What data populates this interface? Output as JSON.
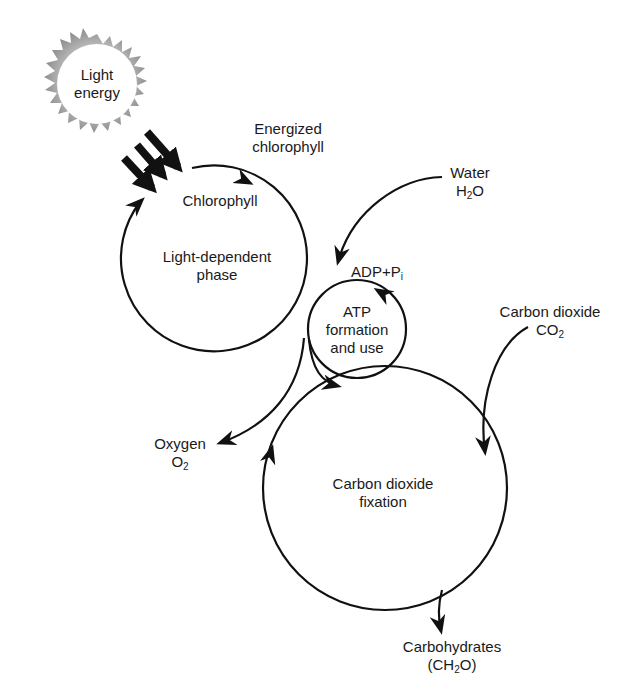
{
  "diagram": {
    "type": "photosynthesis-cycle",
    "colors": {
      "stroke": "#111111",
      "sun_rays": "#a8a8a8",
      "background": "#ffffff"
    },
    "nodes": {
      "light_energy": {
        "line1": "Light",
        "line2": "energy"
      },
      "energized_chlorophyll": {
        "line1": "Energized",
        "line2": "chlorophyll"
      },
      "chlorophyll": {
        "label": "Chlorophyll"
      },
      "light_dependent_phase": {
        "line1": "Light-dependent",
        "line2": "phase"
      },
      "water": {
        "line1": "Water",
        "formula_main": "H",
        "formula_sub": "2",
        "formula_tail": "O"
      },
      "adp_pi": {
        "main": "ADP+P",
        "sub": "i"
      },
      "atp": {
        "line1": "ATP",
        "line2": "formation",
        "line3": "and use"
      },
      "carbon_dioxide": {
        "line1": "Carbon dioxide",
        "formula_main": "CO",
        "formula_sub": "2"
      },
      "oxygen": {
        "line1": "Oxygen",
        "formula_main": "O",
        "formula_sub": "2"
      },
      "co2_fixation": {
        "line1": "Carbon dioxide",
        "line2": "fixation"
      },
      "carbohydrates": {
        "line1": "Carbohydrates",
        "formula_pre": "(CH",
        "formula_sub": "2",
        "formula_tail": "O)"
      }
    },
    "edges": [
      {
        "from": "light_energy",
        "to": "chlorophyll",
        "style": "three thick arrows"
      },
      {
        "from": "chlorophyll",
        "to": "energized_chlorophyll",
        "style": "arc arrow"
      },
      {
        "from": "water",
        "to": "adp_pi",
        "style": "curved arrow"
      },
      {
        "from": "light_dependent_phase",
        "to": "oxygen",
        "style": "curved arrow"
      },
      {
        "from": "light_dependent_phase",
        "to": "co2_fixation",
        "style": "curved arrow"
      },
      {
        "from": "carbon_dioxide",
        "to": "co2_fixation",
        "style": "curved arrow"
      },
      {
        "from": "co2_fixation",
        "to": "carbohydrates",
        "style": "curved arrow"
      }
    ]
  }
}
